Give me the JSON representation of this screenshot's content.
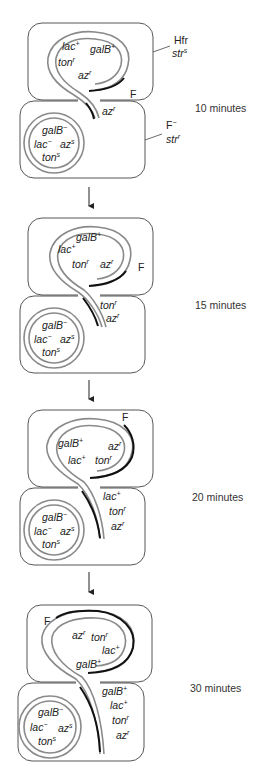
{
  "colors": {
    "cell_outline": "#444444",
    "chromosome": "#8a8a8a",
    "f_factor": "#111111",
    "text": "#222222"
  },
  "labels": {
    "hfr": "Hfr",
    "hfr_str": "str",
    "hfr_str_sup": "s",
    "fminus": "F",
    "fminus_sup": "−",
    "fminus_str": "str",
    "fminus_str_sup": "r"
  },
  "panels": [
    {
      "time": "10 minutes",
      "f_label": "F",
      "donor_genes": [
        {
          "base": "lac",
          "sup": "+"
        },
        {
          "base": "galB",
          "sup": "+"
        },
        {
          "base": "ton",
          "sup": "r"
        },
        {
          "base": "az",
          "sup": "r"
        }
      ],
      "transferred_genes": [
        {
          "base": "az",
          "sup": "r"
        }
      ],
      "recipient_genes": [
        {
          "base": "galB",
          "sup": "−"
        },
        {
          "base": "lac",
          "sup": "−"
        },
        {
          "base": "az",
          "sup": "s"
        },
        {
          "base": "ton",
          "sup": "s"
        }
      ]
    },
    {
      "time": "15 minutes",
      "f_label": "F",
      "donor_genes": [
        {
          "base": "galB",
          "sup": "+"
        },
        {
          "base": "lac",
          "sup": "+"
        },
        {
          "base": "ton",
          "sup": "r"
        },
        {
          "base": "az",
          "sup": "r"
        }
      ],
      "transferred_genes": [
        {
          "base": "ton",
          "sup": "r"
        },
        {
          "base": "az",
          "sup": "r"
        }
      ],
      "recipient_genes": [
        {
          "base": "galB",
          "sup": "−"
        },
        {
          "base": "lac",
          "sup": "−"
        },
        {
          "base": "az",
          "sup": "s"
        },
        {
          "base": "ton",
          "sup": "s"
        }
      ]
    },
    {
      "time": "20 minutes",
      "f_label": "F",
      "donor_genes": [
        {
          "base": "galB",
          "sup": "+"
        },
        {
          "base": "az",
          "sup": "r"
        },
        {
          "base": "lac",
          "sup": "+"
        },
        {
          "base": "ton",
          "sup": "r"
        }
      ],
      "transferred_genes": [
        {
          "base": "lac",
          "sup": "+"
        },
        {
          "base": "ton",
          "sup": "r"
        },
        {
          "base": "az",
          "sup": "r"
        }
      ],
      "recipient_genes": [
        {
          "base": "galB",
          "sup": "−"
        },
        {
          "base": "lac",
          "sup": "−"
        },
        {
          "base": "az",
          "sup": "s"
        },
        {
          "base": "ton",
          "sup": "s"
        }
      ]
    },
    {
      "time": "30 minutes",
      "f_label": "F",
      "donor_genes": [
        {
          "base": "az",
          "sup": "r"
        },
        {
          "base": "ton",
          "sup": "r"
        },
        {
          "base": "lac",
          "sup": "+"
        },
        {
          "base": "galB",
          "sup": "+"
        }
      ],
      "transferred_genes": [
        {
          "base": "galB",
          "sup": "+"
        },
        {
          "base": "lac",
          "sup": "+"
        },
        {
          "base": "ton",
          "sup": "r"
        },
        {
          "base": "az",
          "sup": "r"
        }
      ],
      "recipient_genes": [
        {
          "base": "galB",
          "sup": "−"
        },
        {
          "base": "lac",
          "sup": "−"
        },
        {
          "base": "az",
          "sup": "s"
        },
        {
          "base": "ton",
          "sup": "s"
        }
      ]
    }
  ]
}
